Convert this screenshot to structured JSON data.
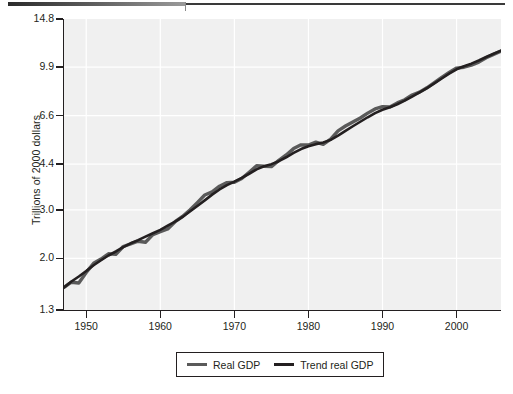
{
  "figure": {
    "background": "#ffffff",
    "panel_color": "#f0f0f0",
    "gridline_color": "#ffffff",
    "axis_color": "#231f20"
  },
  "top_rule": {
    "name": "page-divider-rule"
  },
  "legend": {
    "position": "bottom-center",
    "entries": [
      {
        "label": "Real GDP",
        "color": "#5a5a5a"
      },
      {
        "label": "Trend real GDP",
        "color": "#231f20"
      }
    ]
  },
  "chart_data": {
    "type": "line",
    "title": "",
    "subtitle": "",
    "xlabel": "",
    "ylabel": "Trillions of 2000 dollars",
    "yscale": "log",
    "xlim": [
      1947,
      2006
    ],
    "ylim": [
      1.3,
      14.8
    ],
    "grid": true,
    "xticks": [
      1950,
      1960,
      1970,
      1980,
      1990,
      2000
    ],
    "xticklabels": [
      "1950",
      "1960",
      "1970",
      "1980",
      "1990",
      "2000"
    ],
    "yticks": [
      1.3,
      2.0,
      3.0,
      4.4,
      6.6,
      9.9,
      14.8
    ],
    "yticklabels": [
      "1.3",
      "2.0",
      "3.0",
      "4.4",
      "6.6",
      "9.9",
      "14.8"
    ],
    "annotations": [],
    "x": [
      1947,
      1948,
      1949,
      1950,
      1951,
      1952,
      1953,
      1954,
      1955,
      1956,
      1957,
      1958,
      1959,
      1960,
      1961,
      1962,
      1963,
      1964,
      1965,
      1966,
      1967,
      1968,
      1969,
      1970,
      1971,
      1972,
      1973,
      1974,
      1975,
      1976,
      1977,
      1978,
      1979,
      1980,
      1981,
      1982,
      1983,
      1984,
      1985,
      1986,
      1987,
      1988,
      1989,
      1990,
      1991,
      1992,
      1993,
      1994,
      1995,
      1996,
      1997,
      1998,
      1999,
      2000,
      2001,
      2002,
      2003,
      2004,
      2005,
      2006
    ],
    "series": [
      {
        "name": "Real GDP",
        "color": "#5a5a5a",
        "values": [
          1.57,
          1.64,
          1.63,
          1.78,
          1.92,
          1.99,
          2.08,
          2.07,
          2.21,
          2.26,
          2.31,
          2.29,
          2.44,
          2.5,
          2.56,
          2.72,
          2.84,
          3.0,
          3.19,
          3.4,
          3.49,
          3.66,
          3.77,
          3.78,
          3.9,
          4.11,
          4.34,
          4.32,
          4.31,
          4.54,
          4.75,
          5.01,
          5.17,
          5.16,
          5.29,
          5.19,
          5.42,
          5.81,
          6.05,
          6.26,
          6.47,
          6.74,
          6.98,
          7.11,
          7.1,
          7.34,
          7.54,
          7.84,
          8.03,
          8.33,
          8.7,
          9.09,
          9.47,
          9.82,
          9.89,
          10.07,
          10.32,
          10.7,
          11.01,
          11.31
        ]
      },
      {
        "name": "Trend real GDP",
        "color": "#231f20",
        "values": [
          1.57,
          1.65,
          1.72,
          1.8,
          1.89,
          1.97,
          2.05,
          2.12,
          2.2,
          2.27,
          2.33,
          2.4,
          2.47,
          2.54,
          2.63,
          2.72,
          2.83,
          2.96,
          3.1,
          3.25,
          3.41,
          3.56,
          3.69,
          3.8,
          3.92,
          4.06,
          4.21,
          4.32,
          4.4,
          4.51,
          4.66,
          4.83,
          4.99,
          5.11,
          5.2,
          5.27,
          5.39,
          5.58,
          5.81,
          6.04,
          6.27,
          6.51,
          6.74,
          6.93,
          7.08,
          7.26,
          7.48,
          7.74,
          8.01,
          8.31,
          8.64,
          9.0,
          9.37,
          9.72,
          9.97,
          10.19,
          10.46,
          10.77,
          11.07,
          11.36
        ]
      }
    ]
  }
}
